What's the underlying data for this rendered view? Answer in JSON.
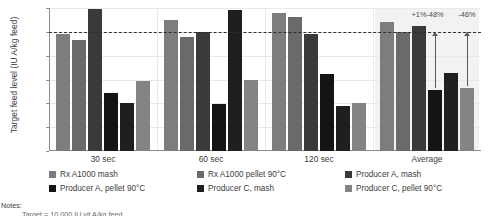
{
  "chart_data": {
    "type": "bar",
    "title": "",
    "xlabel": "",
    "ylabel": "Target feed level (IU A/kg feed)",
    "categories": [
      "30 sec",
      "60 sec",
      "120 sec",
      "Average"
    ],
    "ylim": [
      0,
      12000
    ],
    "yticks": [
      0,
      2000,
      4000,
      6000,
      8000,
      10000,
      12000
    ],
    "ytick_labels": [
      "0",
      "2,000",
      "4,000",
      "6,000",
      "8,000",
      "10,000",
      "12,000"
    ],
    "grid": true,
    "legend_position": "bottom",
    "reference_line": {
      "value": 10000,
      "style": "dashed",
      "label": "Target 10,000 IU vit A/kg feed"
    },
    "series": [
      {
        "name": "Rx A1000 mash",
        "color": "#7d7d7d",
        "values": [
          9850,
          11000,
          11550,
          10800
        ]
      },
      {
        "name": "Rx A1000 pellet 90°C",
        "color": "#6a6a6a",
        "values": [
          9300,
          9600,
          11250,
          10000
        ]
      },
      {
        "name": "Producer A, mash",
        "color": "#3a3a3a",
        "values": [
          11900,
          10000,
          9800,
          10500
        ]
      },
      {
        "name": "Producer A, pellet 90°C",
        "color": "#141414",
        "values": [
          4900,
          3950,
          6450,
          5100
        ]
      },
      {
        "name": "Producer C, mash",
        "color": "#1f1f1f",
        "values": [
          4000,
          11850,
          3800,
          6550
        ]
      },
      {
        "name": "Producer C, pellet 90°C",
        "color": "#848484",
        "values": [
          5900,
          6000,
          4000,
          5300
        ]
      }
    ],
    "annotations": [
      {
        "text": "+1%",
        "series_index": 2,
        "group": "Average"
      },
      {
        "text": "-48%",
        "series_index": 3,
        "group": "Average"
      },
      {
        "text": "-46%",
        "series_index": 5,
        "group": "Average"
      }
    ],
    "highlight_region": "Average"
  },
  "notes": {
    "heading": "Notes:",
    "line1": "Target = 10,000 IU vit A/kg feed"
  }
}
